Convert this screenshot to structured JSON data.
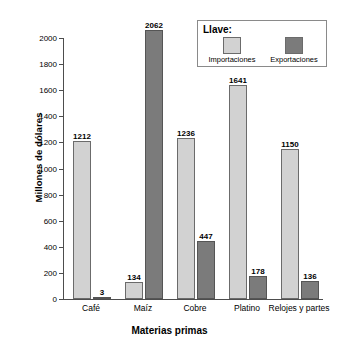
{
  "chart_data": {
    "type": "bar",
    "title": "",
    "xlabel": "Materias primas",
    "ylabel": "Millones de dólares",
    "categories": [
      "Café",
      "Maíz",
      "Cobre",
      "Platino",
      "Relojes y partes"
    ],
    "series": [
      {
        "name": "Importaciones",
        "color": "#d2d2d2",
        "values": [
          1212,
          134,
          1236,
          1641,
          1150
        ]
      },
      {
        "name": "Exportaciones",
        "color": "#7b7b7b",
        "values": [
          3,
          2062,
          447,
          178,
          136
        ]
      }
    ],
    "ylim": [
      0,
      2000
    ],
    "ytick_step": 200,
    "yticks": [
      0,
      200,
      400,
      600,
      800,
      1000,
      1200,
      1400,
      1600,
      1800,
      2000
    ],
    "ytick_labels": [
      "0",
      "200",
      "400",
      "600",
      "800",
      "1000",
      "1200",
      "1400",
      "1600",
      "1800",
      "2000"
    ],
    "grid": false,
    "legend_position": "top-right",
    "legend": {
      "title": "Llave:",
      "entries": [
        {
          "label": "Importaciones",
          "color": "#d2d2d2"
        },
        {
          "label": "Exportaciones",
          "color": "#7b7b7b"
        }
      ]
    },
    "data_labels": [
      {
        "category": "Café",
        "importaciones": "1212",
        "exportaciones": "3"
      },
      {
        "category": "Maíz",
        "importaciones": "134",
        "exportaciones": "2062"
      },
      {
        "category": "Cobre",
        "importaciones": "1236",
        "exportaciones": "447"
      },
      {
        "category": "Platino",
        "importaciones": "1641",
        "exportaciones": "178"
      },
      {
        "category": "Relojes y partes",
        "importaciones": "1150",
        "exportaciones": "136"
      }
    ]
  }
}
